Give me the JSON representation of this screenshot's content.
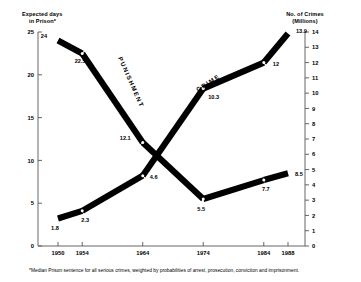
{
  "chart_data": {
    "type": "line",
    "title": "",
    "subtitle": "",
    "categories": [
      "1950",
      "1954",
      "1964",
      "1974",
      "1984",
      "1988"
    ],
    "x": [
      1950,
      1954,
      1964,
      1974,
      1984,
      1988
    ],
    "xlabel": "",
    "grid": false,
    "legend_position": "inline-along-series",
    "series": [
      {
        "name": "PUNISHMENT",
        "axis": "left",
        "values": [
          24,
          22.5,
          12.1,
          5.5,
          7.7,
          8.5
        ],
        "value_labels": [
          "24",
          "22.5",
          "12.1",
          "5.5",
          "7.7",
          "8.5"
        ]
      },
      {
        "name": "CRIME",
        "axis": "right",
        "values": [
          1.8,
          2.3,
          4.6,
          10.3,
          12,
          13.9
        ],
        "value_labels": [
          "1.8",
          "2.3",
          "4.6",
          "10.3",
          "12",
          "13.9"
        ]
      }
    ],
    "left_axis": {
      "title_line1": "Expected days",
      "title_line2": "in Prison*",
      "ylim": [
        0,
        25
      ],
      "ticks": [
        0,
        5,
        10,
        15,
        20,
        25
      ],
      "tick_labels": [
        "0",
        "5",
        "10",
        "15",
        "20",
        "25"
      ]
    },
    "right_axis": {
      "title_line1": "No. of Crimes",
      "title_line2": "(Millions)",
      "ylim": [
        0,
        14
      ],
      "ticks": [
        0,
        1,
        2,
        3,
        4,
        5,
        6,
        7,
        8,
        9,
        10,
        11,
        12,
        13,
        14
      ],
      "tick_labels": [
        "0",
        "1",
        "2",
        "3",
        "4",
        "5",
        "6",
        "7",
        "8",
        "9",
        "10",
        "11",
        "12",
        "13",
        "14"
      ]
    },
    "annotations": [
      {
        "name": "footnote",
        "text": "*Median Prison sentence for all serious crimes, weighted by probabilities of arrest, prosecution, conviction and imprisonment."
      }
    ],
    "colors": {
      "series_stroke": "#000000",
      "axis": "#555555",
      "background": "#ffffff",
      "text": "#000000"
    }
  }
}
